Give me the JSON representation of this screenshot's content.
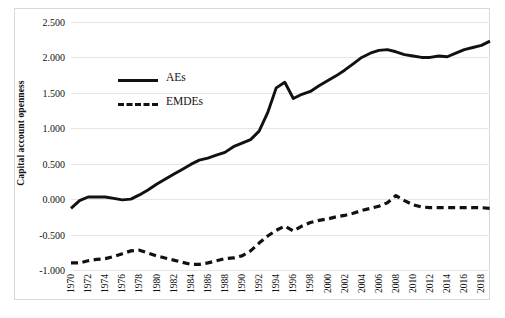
{
  "chart_data": {
    "type": "line",
    "title": "",
    "xlabel": "",
    "ylabel": "Capital account openness",
    "ylim": [
      -1.0,
      2.5
    ],
    "ystep": 0.5,
    "ytick_labels": [
      "2.500",
      "2.000",
      "1.500",
      "1.000",
      "0.500",
      "0.000",
      "-0.500",
      "-1.000"
    ],
    "ytick_values": [
      2.5,
      2.0,
      1.5,
      1.0,
      0.5,
      0.0,
      -0.5,
      -1.0
    ],
    "xlim": [
      1970,
      2019
    ],
    "xtick_labels": [
      "1970",
      "1972",
      "1974",
      "1976",
      "1978",
      "1980",
      "1982",
      "1984",
      "1986",
      "1988",
      "1990",
      "1992",
      "1994",
      "1996",
      "1998",
      "2000",
      "2002",
      "2004",
      "2006",
      "2008",
      "2010",
      "2012",
      "2014",
      "2016",
      "2018"
    ],
    "grid": "horizontal",
    "legend_position": "inside-upper-left",
    "x": [
      1970,
      1971,
      1972,
      1973,
      1974,
      1975,
      1976,
      1977,
      1978,
      1979,
      1980,
      1981,
      1982,
      1983,
      1984,
      1985,
      1986,
      1987,
      1988,
      1989,
      1990,
      1991,
      1992,
      1993,
      1994,
      1995,
      1996,
      1997,
      1998,
      1999,
      2000,
      2001,
      2002,
      2003,
      2004,
      2005,
      2006,
      2007,
      2008,
      2009,
      2010,
      2011,
      2012,
      2013,
      2014,
      2015,
      2016,
      2017,
      2018,
      2019
    ],
    "series": [
      {
        "name": "AEs",
        "style": "solid",
        "color": "#111111",
        "values": [
          -0.13,
          -0.02,
          0.03,
          0.03,
          0.03,
          0.01,
          -0.01,
          0.0,
          0.06,
          0.13,
          0.21,
          0.28,
          0.35,
          0.42,
          0.49,
          0.55,
          0.58,
          0.62,
          0.66,
          0.74,
          0.79,
          0.84,
          0.96,
          1.22,
          1.57,
          1.65,
          1.42,
          1.48,
          1.52,
          1.6,
          1.67,
          1.74,
          1.82,
          1.91,
          2.0,
          2.06,
          2.1,
          2.11,
          2.08,
          2.04,
          2.02,
          2.0,
          2.0,
          2.02,
          2.01,
          2.06,
          2.11,
          2.14,
          2.17,
          2.23
        ]
      },
      {
        "name": "EMDEs",
        "style": "dashed",
        "color": "#111111",
        "values": [
          -0.9,
          -0.9,
          -0.87,
          -0.85,
          -0.84,
          -0.81,
          -0.77,
          -0.73,
          -0.72,
          -0.76,
          -0.8,
          -0.83,
          -0.86,
          -0.89,
          -0.92,
          -0.92,
          -0.9,
          -0.87,
          -0.84,
          -0.83,
          -0.8,
          -0.73,
          -0.62,
          -0.52,
          -0.44,
          -0.38,
          -0.45,
          -0.38,
          -0.33,
          -0.3,
          -0.28,
          -0.25,
          -0.23,
          -0.2,
          -0.16,
          -0.13,
          -0.1,
          -0.05,
          0.05,
          -0.02,
          -0.08,
          -0.11,
          -0.12,
          -0.12,
          -0.12,
          -0.12,
          -0.12,
          -0.12,
          -0.12,
          -0.13
        ]
      }
    ]
  },
  "legend": {
    "items": [
      {
        "label": "AEs",
        "style": "solid"
      },
      {
        "label": "EMDEs",
        "style": "dashed"
      }
    ]
  }
}
